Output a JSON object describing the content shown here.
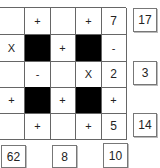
{
  "puzzle": {
    "grid": [
      [
        "",
        "+",
        "",
        "+",
        "7"
      ],
      [
        "X",
        "#",
        "+",
        "#",
        "-"
      ],
      [
        "",
        "-",
        "",
        "X",
        "2"
      ],
      [
        "+",
        "#",
        "+",
        "#",
        "+"
      ],
      [
        "",
        "+",
        "",
        "+",
        "5"
      ]
    ],
    "row_results": [
      "17",
      "3",
      "14"
    ],
    "column_results": [
      "62",
      "8",
      "10"
    ]
  }
}
